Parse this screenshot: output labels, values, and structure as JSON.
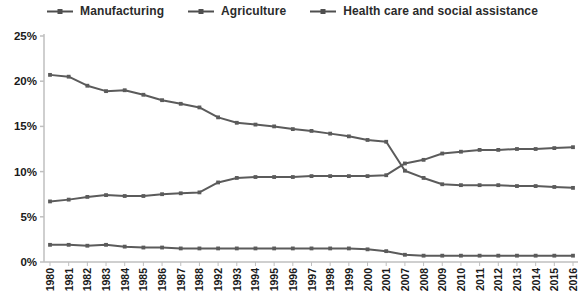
{
  "chart_data": {
    "type": "line",
    "title": "",
    "xlabel": "",
    "ylabel": "",
    "categories": [
      "1980",
      "1981",
      "1982",
      "1983",
      "1984",
      "1985",
      "1986",
      "1987",
      "1988",
      "1992",
      "1993",
      "1994",
      "1995",
      "1996",
      "1997",
      "1998",
      "1999",
      "2000",
      "2001",
      "2007",
      "2008",
      "2009",
      "2010",
      "2011",
      "2012",
      "2013",
      "2014",
      "2015",
      "2016"
    ],
    "series": [
      {
        "name": "Manufacturing",
        "values": [
          20.7,
          20.5,
          19.5,
          18.9,
          19.0,
          18.5,
          17.9,
          17.5,
          17.1,
          16.0,
          15.4,
          15.2,
          15.0,
          14.7,
          14.5,
          14.2,
          13.9,
          13.5,
          13.3,
          10.1,
          9.3,
          8.6,
          8.5,
          8.5,
          8.5,
          8.4,
          8.4,
          8.3,
          8.2
        ]
      },
      {
        "name": "Agriculture",
        "values": [
          1.9,
          1.9,
          1.8,
          1.9,
          1.7,
          1.6,
          1.6,
          1.5,
          1.5,
          1.5,
          1.5,
          1.5,
          1.5,
          1.5,
          1.5,
          1.5,
          1.5,
          1.4,
          1.2,
          0.8,
          0.7,
          0.7,
          0.7,
          0.7,
          0.7,
          0.7,
          0.7,
          0.7,
          0.7
        ]
      },
      {
        "name": "Health care and social assistance",
        "values": [
          6.7,
          6.9,
          7.2,
          7.4,
          7.3,
          7.3,
          7.5,
          7.6,
          7.7,
          8.8,
          9.3,
          9.4,
          9.4,
          9.4,
          9.5,
          9.5,
          9.5,
          9.5,
          9.6,
          10.9,
          11.3,
          12.0,
          12.2,
          12.4,
          12.4,
          12.5,
          12.5,
          12.6,
          12.7
        ]
      }
    ],
    "ylim": [
      0,
      25
    ],
    "ytick_labels": [
      "0%",
      "5%",
      "10%",
      "15%",
      "20%",
      "25%"
    ],
    "ytick_values": [
      0,
      5,
      10,
      15,
      20,
      25
    ],
    "legend_position": "top",
    "grid": false,
    "line_color": "#5b5b5b",
    "axis_color": "#bfbfbf",
    "text_color": "#1a1a1a"
  }
}
